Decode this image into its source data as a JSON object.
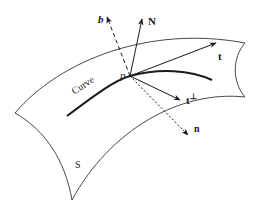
{
  "diagram": {
    "type": "surface-curve-frame",
    "surface_label": "S",
    "curve_label": "Curve",
    "point_label": "p",
    "vectors": [
      {
        "id": "b",
        "label": "b",
        "style": "dashed"
      },
      {
        "id": "N",
        "label": "N",
        "style": "solid"
      },
      {
        "id": "t",
        "label": "t",
        "style": "solid"
      },
      {
        "id": "t_perp",
        "label": "t",
        "superscript": "⊥",
        "style": "solid"
      },
      {
        "id": "n",
        "label": "n",
        "style": "dashed"
      }
    ],
    "colors": {
      "stroke": "#1a1a1a",
      "surface_edge": "#333333",
      "background": "#ffffff"
    }
  }
}
